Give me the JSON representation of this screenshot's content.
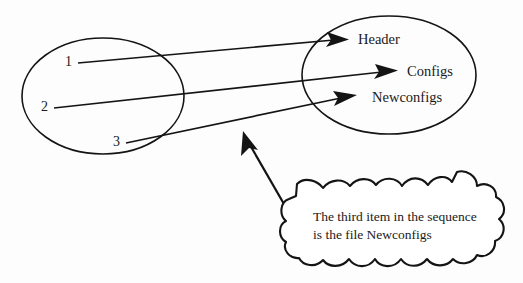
{
  "figure": {
    "background_color": "#fdfdfd",
    "ink_color": "#141414",
    "left_set": {
      "name": "sequence-positions",
      "items": [
        {
          "label": "1"
        },
        {
          "label": "2"
        },
        {
          "label": "3"
        }
      ]
    },
    "right_set": {
      "name": "file-names",
      "items": [
        {
          "label": "Header"
        },
        {
          "label": "Configs"
        },
        {
          "label": "Newconfigs"
        }
      ]
    },
    "mappings": [
      {
        "from": "1",
        "to": "Header"
      },
      {
        "from": "2",
        "to": "Configs"
      },
      {
        "from": "3",
        "to": "Newconfigs"
      }
    ],
    "callout": {
      "line1": "The third item in the sequence",
      "line2": "is the file Newconfigs",
      "points_to": "Newconfigs"
    }
  }
}
